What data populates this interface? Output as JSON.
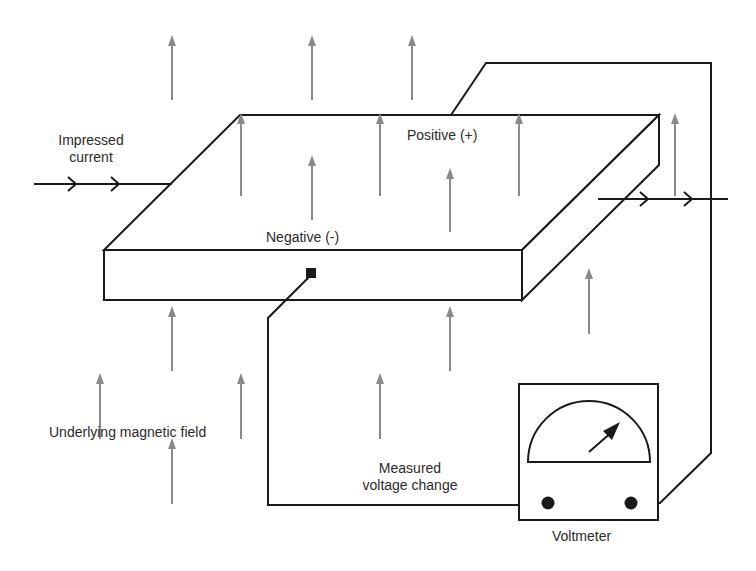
{
  "diagram": {
    "labels": {
      "impressed_current": [
        "Impressed",
        "current"
      ],
      "positive": "Positive (+)",
      "negative": "Negative (-)",
      "magnetic_field": "Underlying magnetic field",
      "measured_voltage": [
        "Measured",
        "voltage change"
      ],
      "voltmeter": "Voltmeter"
    },
    "colors": {
      "line": "#1a1a1a",
      "field_arrow": "#8a8a8a",
      "text": "#2a2a2a",
      "background": "#ffffff"
    },
    "field_arrows": [
      {
        "x": 172,
        "y1": 100,
        "y2": 35
      },
      {
        "x": 312,
        "y1": 100,
        "y2": 35
      },
      {
        "x": 412,
        "y1": 100,
        "y2": 35
      },
      {
        "x": 241,
        "y1": 196,
        "y2": 113
      },
      {
        "x": 380,
        "y1": 196,
        "y2": 113
      },
      {
        "x": 519,
        "y1": 196,
        "y2": 113
      },
      {
        "x": 675,
        "y1": 196,
        "y2": 113
      },
      {
        "x": 312,
        "y1": 220,
        "y2": 155
      },
      {
        "x": 450,
        "y1": 232,
        "y2": 168
      },
      {
        "x": 589,
        "y1": 334,
        "y2": 268
      },
      {
        "x": 450,
        "y1": 371,
        "y2": 306
      },
      {
        "x": 172,
        "y1": 371,
        "y2": 306
      },
      {
        "x": 380,
        "y1": 439,
        "y2": 373
      },
      {
        "x": 100,
        "y1": 439,
        "y2": 373
      },
      {
        "x": 241,
        "y1": 439,
        "y2": 373
      },
      {
        "x": 172,
        "y1": 504,
        "y2": 438
      }
    ]
  }
}
